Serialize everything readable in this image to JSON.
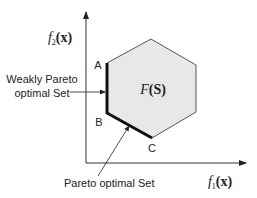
{
  "diagram": {
    "axes": {
      "x_label": {
        "func": "f",
        "sub": "1",
        "arg": "(x)"
      },
      "y_label": {
        "func": "f",
        "sub": "2",
        "arg": "(x)"
      }
    },
    "region": {
      "label_func": "F",
      "label_arg": "(S)",
      "fill": "#e8e8e8",
      "stroke": "#555555"
    },
    "points": {
      "A": "A",
      "B": "B",
      "C": "C"
    },
    "annotations": {
      "weakly_line1": "Weakly Pareto",
      "weakly_line2": "optimal Set",
      "pareto": "Pareto optimal Set"
    }
  }
}
